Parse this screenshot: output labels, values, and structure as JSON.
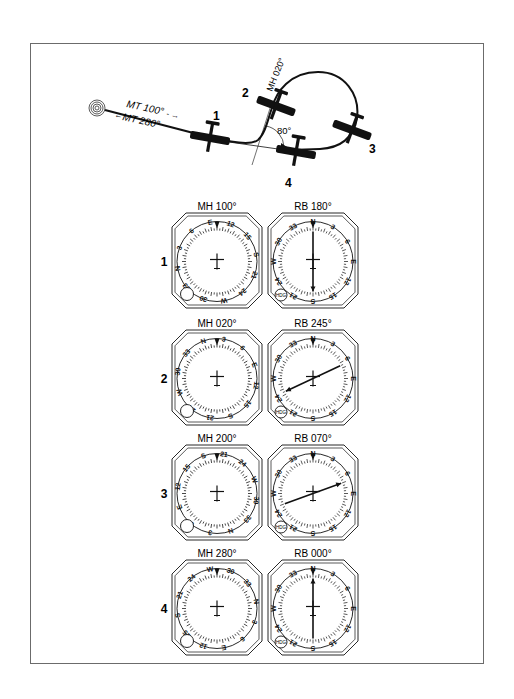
{
  "diagram": {
    "ndb": {
      "label": "NDB",
      "icon": "ndb-station-icon"
    },
    "track_out_label": "MT 100°",
    "track_in_label": "MT 280°",
    "heading_label": "MH 020°",
    "angle_label": "80°",
    "positions": [
      {
        "id": "1",
        "label": "1"
      },
      {
        "id": "2",
        "label": "2"
      },
      {
        "id": "3",
        "label": "3"
      },
      {
        "id": "4",
        "label": "4"
      }
    ]
  },
  "instruments": {
    "hdg_knob_label": "HDG",
    "rows": [
      {
        "row_label": "1",
        "mh_label": "MH 100°",
        "mh": 100,
        "rb_label": "RB 180°",
        "rb": 180
      },
      {
        "row_label": "2",
        "mh_label": "MH 020°",
        "mh": 20,
        "rb_label": "RB 245°",
        "rb": 245
      },
      {
        "row_label": "3",
        "mh_label": "MH 200°",
        "mh": 200,
        "rb_label": "RB 070°",
        "rb": 70
      },
      {
        "row_label": "4",
        "mh_label": "MH 280°",
        "mh": 280,
        "rb_label": "RB 000°",
        "rb": 0
      }
    ]
  },
  "colors": {
    "ink": "#111111",
    "frame": "#6b6b6b",
    "paper": "#ffffff"
  }
}
